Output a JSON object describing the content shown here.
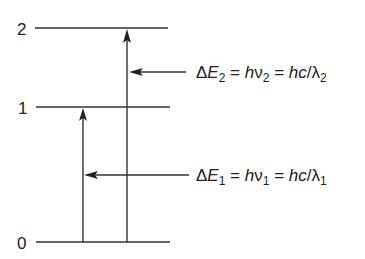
{
  "diagram": {
    "type": "energy-level-diagram",
    "levels": [
      {
        "label": "0",
        "y": 242
      },
      {
        "label": "1",
        "y": 107
      },
      {
        "label": "2",
        "y": 28
      }
    ],
    "transitions": [
      {
        "from": "0",
        "to": "1",
        "x": 83,
        "name": "transition-0-to-1"
      },
      {
        "from": "0",
        "to": "2",
        "x": 127,
        "name": "transition-0-to-2"
      }
    ],
    "annotations": [
      {
        "name": "delta-e2",
        "text": "ΔE2 = hν2 = hc/λ2",
        "parts": {
          "delta": "Δ",
          "E": "E",
          "sub1": "2",
          "eq1": " = ",
          "h1": "h",
          "nu": "ν",
          "sub2": "2",
          "eq2": " = ",
          "hc": "hc",
          "slash": "/",
          "lambda": "λ",
          "sub3": "2"
        },
        "arrow_y": 72,
        "points_to": "transition-0-to-2"
      },
      {
        "name": "delta-e1",
        "text": "ΔE1 = hν1 = hc/λ1",
        "parts": {
          "delta": "Δ",
          "E": "E",
          "sub1": "1",
          "eq1": " = ",
          "h1": "h",
          "nu": "ν",
          "sub2": "1",
          "eq2": " = ",
          "hc": "hc",
          "slash": "/",
          "lambda": "λ",
          "sub3": "1"
        },
        "arrow_y": 175,
        "points_to": "transition-0-to-1"
      }
    ],
    "colors": {
      "line": "#333333",
      "text": "#222222",
      "background": "#ffffff"
    }
  }
}
